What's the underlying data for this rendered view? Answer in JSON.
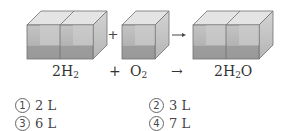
{
  "figure": {
    "colors": {
      "front_top": "#b9b9b9",
      "front_bottom": "#9a9a9a",
      "top_face": "#e2e2e2",
      "side_face": "#c9c9c9",
      "edge": "#6f6f6f",
      "inner_back": "#d6d6d6"
    },
    "operators": {
      "plus": "+",
      "arrow": "→"
    }
  },
  "equation": {
    "reactant1": {
      "coef": "2H",
      "sub": "2"
    },
    "plus": "+",
    "reactant2": {
      "coef": "O",
      "sub": "2"
    },
    "arrow": "→",
    "product": {
      "pre": "2H",
      "sub": "2",
      "post": "O"
    }
  },
  "options": [
    {
      "marker": "1",
      "text": "2 L"
    },
    {
      "marker": "2",
      "text": "3 L"
    },
    {
      "marker": "3",
      "text": "6 L"
    },
    {
      "marker": "4",
      "text": "7 L"
    }
  ]
}
